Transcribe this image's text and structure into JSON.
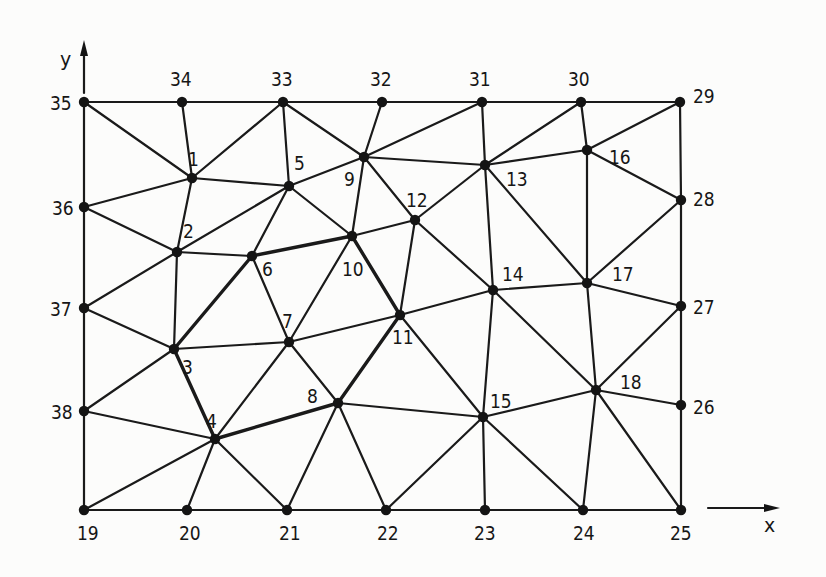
{
  "figure": {
    "type": "finite-element-triangular-mesh",
    "axes": {
      "x_label": "x",
      "y_label": "y"
    }
  },
  "nodes": [
    {
      "id": "1",
      "x": 192,
      "y": 178,
      "lx": 188,
      "ly": 166,
      "bold": false
    },
    {
      "id": "2",
      "x": 177,
      "y": 252,
      "lx": 183,
      "ly": 238
    },
    {
      "id": "3",
      "x": 174,
      "y": 349,
      "lx": 182,
      "ly": 374
    },
    {
      "id": "4",
      "x": 215,
      "y": 439,
      "lx": 206,
      "ly": 428
    },
    {
      "id": "5",
      "x": 289,
      "y": 186,
      "lx": 294,
      "ly": 170
    },
    {
      "id": "6",
      "x": 252,
      "y": 256,
      "lx": 262,
      "ly": 276
    },
    {
      "id": "7",
      "x": 289,
      "y": 342,
      "lx": 282,
      "ly": 328
    },
    {
      "id": "8",
      "x": 338,
      "y": 403,
      "lx": 307,
      "ly": 403
    },
    {
      "id": "9",
      "x": 364,
      "y": 157,
      "lx": 344,
      "ly": 186
    },
    {
      "id": "10",
      "x": 352,
      "y": 236,
      "lx": 342,
      "ly": 276
    },
    {
      "id": "11",
      "x": 400,
      "y": 315,
      "lx": 392,
      "ly": 344
    },
    {
      "id": "12",
      "x": 415,
      "y": 220,
      "lx": 406,
      "ly": 207
    },
    {
      "id": "13",
      "x": 485,
      "y": 165,
      "lx": 506,
      "ly": 186
    },
    {
      "id": "14",
      "x": 493,
      "y": 290,
      "lx": 502,
      "ly": 281
    },
    {
      "id": "15",
      "x": 483,
      "y": 417,
      "lx": 490,
      "ly": 408
    },
    {
      "id": "16",
      "x": 587,
      "y": 150,
      "lx": 609,
      "ly": 164
    },
    {
      "id": "17",
      "x": 587,
      "y": 283,
      "lx": 612,
      "ly": 281
    },
    {
      "id": "18",
      "x": 596,
      "y": 390,
      "lx": 620,
      "ly": 389
    },
    {
      "id": "19",
      "x": 84,
      "y": 510,
      "lx": 77,
      "ly": 540
    },
    {
      "id": "20",
      "x": 187,
      "y": 510,
      "lx": 179,
      "ly": 540
    },
    {
      "id": "21",
      "x": 287,
      "y": 510,
      "lx": 279,
      "ly": 540
    },
    {
      "id": "22",
      "x": 386,
      "y": 510,
      "lx": 377,
      "ly": 540
    },
    {
      "id": "23",
      "x": 485,
      "y": 510,
      "lx": 474,
      "ly": 540
    },
    {
      "id": "24",
      "x": 583,
      "y": 510,
      "lx": 573,
      "ly": 540
    },
    {
      "id": "25",
      "x": 681,
      "y": 510,
      "lx": 670,
      "ly": 540
    },
    {
      "id": "26",
      "x": 681,
      "y": 405,
      "lx": 693,
      "ly": 414
    },
    {
      "id": "27",
      "x": 681,
      "y": 306,
      "lx": 693,
      "ly": 314
    },
    {
      "id": "28",
      "x": 681,
      "y": 200,
      "lx": 693,
      "ly": 206
    },
    {
      "id": "29",
      "x": 680,
      "y": 102,
      "lx": 693,
      "ly": 103
    },
    {
      "id": "30",
      "x": 581,
      "y": 102,
      "lx": 568,
      "ly": 86
    },
    {
      "id": "31",
      "x": 482,
      "y": 102,
      "lx": 469,
      "ly": 86
    },
    {
      "id": "32",
      "x": 382,
      "y": 102,
      "lx": 370,
      "ly": 86
    },
    {
      "id": "33",
      "x": 283,
      "y": 102,
      "lx": 271,
      "ly": 86
    },
    {
      "id": "34",
      "x": 182,
      "y": 102,
      "lx": 170,
      "ly": 86
    },
    {
      "id": "35",
      "x": 84,
      "y": 102,
      "lx": 50,
      "ly": 110
    },
    {
      "id": "36",
      "x": 84,
      "y": 207,
      "lx": 52,
      "ly": 215
    },
    {
      "id": "37",
      "x": 84,
      "y": 308,
      "lx": 50,
      "ly": 316
    },
    {
      "id": "38",
      "x": 84,
      "y": 411,
      "lx": 51,
      "ly": 419
    }
  ],
  "edges": [
    [
      "35",
      "34"
    ],
    [
      "34",
      "33"
    ],
    [
      "33",
      "32"
    ],
    [
      "32",
      "31"
    ],
    [
      "31",
      "30"
    ],
    [
      "30",
      "29"
    ],
    [
      "19",
      "20"
    ],
    [
      "20",
      "21"
    ],
    [
      "21",
      "22"
    ],
    [
      "22",
      "23"
    ],
    [
      "23",
      "24"
    ],
    [
      "24",
      "25"
    ],
    [
      "35",
      "36"
    ],
    [
      "36",
      "37"
    ],
    [
      "37",
      "38"
    ],
    [
      "38",
      "19"
    ],
    [
      "29",
      "28"
    ],
    [
      "28",
      "27"
    ],
    [
      "27",
      "26"
    ],
    [
      "26",
      "25"
    ],
    [
      "35",
      "1"
    ],
    [
      "34",
      "1"
    ],
    [
      "33",
      "1"
    ],
    [
      "1",
      "36"
    ],
    [
      "1",
      "5"
    ],
    [
      "1",
      "2"
    ],
    [
      "33",
      "5"
    ],
    [
      "33",
      "9"
    ],
    [
      "32",
      "9"
    ],
    [
      "31",
      "9"
    ],
    [
      "31",
      "13"
    ],
    [
      "30",
      "13"
    ],
    [
      "30",
      "16"
    ],
    [
      "29",
      "16"
    ],
    [
      "36",
      "2"
    ],
    [
      "2",
      "5"
    ],
    [
      "2",
      "6"
    ],
    [
      "2",
      "37"
    ],
    [
      "2",
      "3"
    ],
    [
      "5",
      "6"
    ],
    [
      "5",
      "9"
    ],
    [
      "5",
      "10"
    ],
    [
      "9",
      "10"
    ],
    [
      "9",
      "12"
    ],
    [
      "9",
      "13"
    ],
    [
      "6",
      "10"
    ],
    [
      "6",
      "7"
    ],
    [
      "6",
      "3"
    ],
    [
      "10",
      "12"
    ],
    [
      "10",
      "7"
    ],
    [
      "10",
      "11"
    ],
    [
      "12",
      "13"
    ],
    [
      "12",
      "11"
    ],
    [
      "12",
      "14"
    ],
    [
      "13",
      "16"
    ],
    [
      "13",
      "14"
    ],
    [
      "13",
      "17"
    ],
    [
      "16",
      "17"
    ],
    [
      "16",
      "28"
    ],
    [
      "17",
      "28"
    ],
    [
      "17",
      "14"
    ],
    [
      "17",
      "27"
    ],
    [
      "17",
      "18"
    ],
    [
      "37",
      "3"
    ],
    [
      "3",
      "7"
    ],
    [
      "3",
      "38"
    ],
    [
      "3",
      "4"
    ],
    [
      "7",
      "11"
    ],
    [
      "7",
      "4"
    ],
    [
      "7",
      "8"
    ],
    [
      "11",
      "14"
    ],
    [
      "11",
      "8"
    ],
    [
      "11",
      "15"
    ],
    [
      "14",
      "15"
    ],
    [
      "14",
      "18"
    ],
    [
      "38",
      "4"
    ],
    [
      "4",
      "8"
    ],
    [
      "4",
      "19"
    ],
    [
      "4",
      "20"
    ],
    [
      "4",
      "21"
    ],
    [
      "8",
      "15"
    ],
    [
      "8",
      "21"
    ],
    [
      "8",
      "22"
    ],
    [
      "15",
      "18"
    ],
    [
      "15",
      "22"
    ],
    [
      "15",
      "23"
    ],
    [
      "15",
      "24"
    ],
    [
      "18",
      "27"
    ],
    [
      "18",
      "26"
    ],
    [
      "18",
      "24"
    ],
    [
      "18",
      "25"
    ]
  ],
  "bold_edges": [
    [
      "6",
      "10"
    ],
    [
      "6",
      "3"
    ],
    [
      "3",
      "4"
    ],
    [
      "4",
      "8"
    ],
    [
      "8",
      "11"
    ],
    [
      "11",
      "10"
    ]
  ],
  "axes_geom": {
    "y_arrow": {
      "x": 84,
      "y1": 93,
      "y2": 40,
      "label_x": 60,
      "label_y": 66
    },
    "x_arrow": {
      "y": 508,
      "x1": 708,
      "x2": 780,
      "label_x": 764,
      "label_y": 532
    }
  }
}
